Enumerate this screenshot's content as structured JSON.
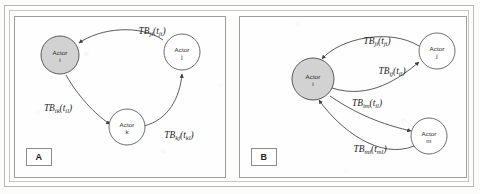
{
  "figure": {
    "type": "two-panel directed graph diagram",
    "colors": {
      "page": "#fcfcfb",
      "frame": "#b9b9b9",
      "panel_border": "#9e9e9e",
      "node_stroke": "#5e5e5e",
      "node_fill": "#ffffff",
      "focal_node_fill": "#d2d2d2",
      "arc": "#3f3f3f",
      "text": "#1d1d1d"
    }
  },
  "panels": [
    {
      "tag": "A",
      "nodes": [
        {
          "id": "i",
          "label_line1": "Actor",
          "label_line2": "i",
          "shaded": true,
          "cx": 60,
          "cy": 55,
          "r": 19
        },
        {
          "id": "j",
          "label_line1": "Actor",
          "label_line2": "j",
          "shaded": false,
          "cx": 182,
          "cy": 52,
          "r": 18
        },
        {
          "id": "k",
          "label_line1": "Actor",
          "label_line2": "k",
          "shaded": false,
          "cx": 127,
          "cy": 127,
          "r": 18
        }
      ],
      "arcs": [
        {
          "id": "ji",
          "from": "j",
          "to": "i",
          "label_main": "TB",
          "label_sub1": "ji",
          "label_arg": "t",
          "label_sub2": "ji",
          "lx": 152,
          "ly": 34
        },
        {
          "id": "ik",
          "from": "i",
          "to": "k",
          "label_main": "TB",
          "label_sub1": "ik",
          "label_arg": "t",
          "label_sub2": "il",
          "lx": 58,
          "ly": 111
        },
        {
          "id": "kj",
          "from": "k",
          "to": "j",
          "label_main": "TB",
          "label_sub1": "kj",
          "label_arg": "t",
          "label_sub2": "kl",
          "lx": 179,
          "ly": 138
        }
      ]
    },
    {
      "tag": "B",
      "nodes": [
        {
          "id": "i",
          "label_line1": "Actor",
          "label_line2": "i",
          "shaded": true,
          "cx": 313,
          "cy": 79,
          "r": 21
        },
        {
          "id": "j",
          "label_line1": "Actor",
          "label_line2": "j",
          "shaded": false,
          "cx": 437,
          "cy": 51,
          "r": 18
        },
        {
          "id": "m",
          "label_line1": "Actor",
          "label_line2": "m",
          "shaded": false,
          "cx": 429,
          "cy": 136,
          "r": 18
        }
      ],
      "arcs": [
        {
          "id": "ji",
          "from": "j",
          "to": "i",
          "label_main": "TB",
          "label_sub1": "ji",
          "label_arg": "t",
          "label_sub2": "ji",
          "lx": 377,
          "ly": 44
        },
        {
          "id": "ij",
          "from": "i",
          "to": "j",
          "label_main": "TB",
          "label_sub1": "ij",
          "label_arg": "t",
          "label_sub2": "il",
          "lx": 392,
          "ly": 74
        },
        {
          "id": "im",
          "from": "i",
          "to": "m",
          "label_main": "TB",
          "label_sub1": "im",
          "label_arg": "t",
          "label_sub2": "il",
          "lx": 367,
          "ly": 106
        },
        {
          "id": "mi",
          "from": "m",
          "to": "i",
          "label_main": "TB",
          "label_sub1": "mi",
          "label_arg": "t",
          "label_sub2": "ml",
          "lx": 370,
          "ly": 152
        }
      ]
    }
  ],
  "geometry": {
    "panelA_arcs": [
      "M 163 40 C 140 24, 100 28, 79 43",
      "M 66 75 C 80 100, 100 118, 110 124",
      "M 144 126 C 168 120, 180 98, 182 74"
    ],
    "panelA_heads": [
      {
        "x": 79,
        "y": 43,
        "rot": 145
      },
      {
        "x": 110,
        "y": 124,
        "rot": 58
      },
      {
        "x": 182,
        "y": 74,
        "rot": -80
      }
    ],
    "panelB_arcs": [
      "M 419 46 C 390 28, 340 38, 322 59",
      "M 332 88 C 370 100, 400 78, 419 62",
      "M 330 96 C 362 118, 390 126, 411 131",
      "M 414 146 C 380 160, 340 130, 319 100"
    ],
    "panelB_heads": [
      {
        "x": 322,
        "y": 59,
        "rot": 131
      },
      {
        "x": 419,
        "y": 62,
        "rot": -41
      },
      {
        "x": 411,
        "y": 131,
        "rot": 17
      },
      {
        "x": 319,
        "y": 100,
        "rot": -124
      }
    ],
    "tagA": {
      "x": 26,
      "y": 148
    },
    "tagB": {
      "x": 251,
      "y": 148
    }
  }
}
